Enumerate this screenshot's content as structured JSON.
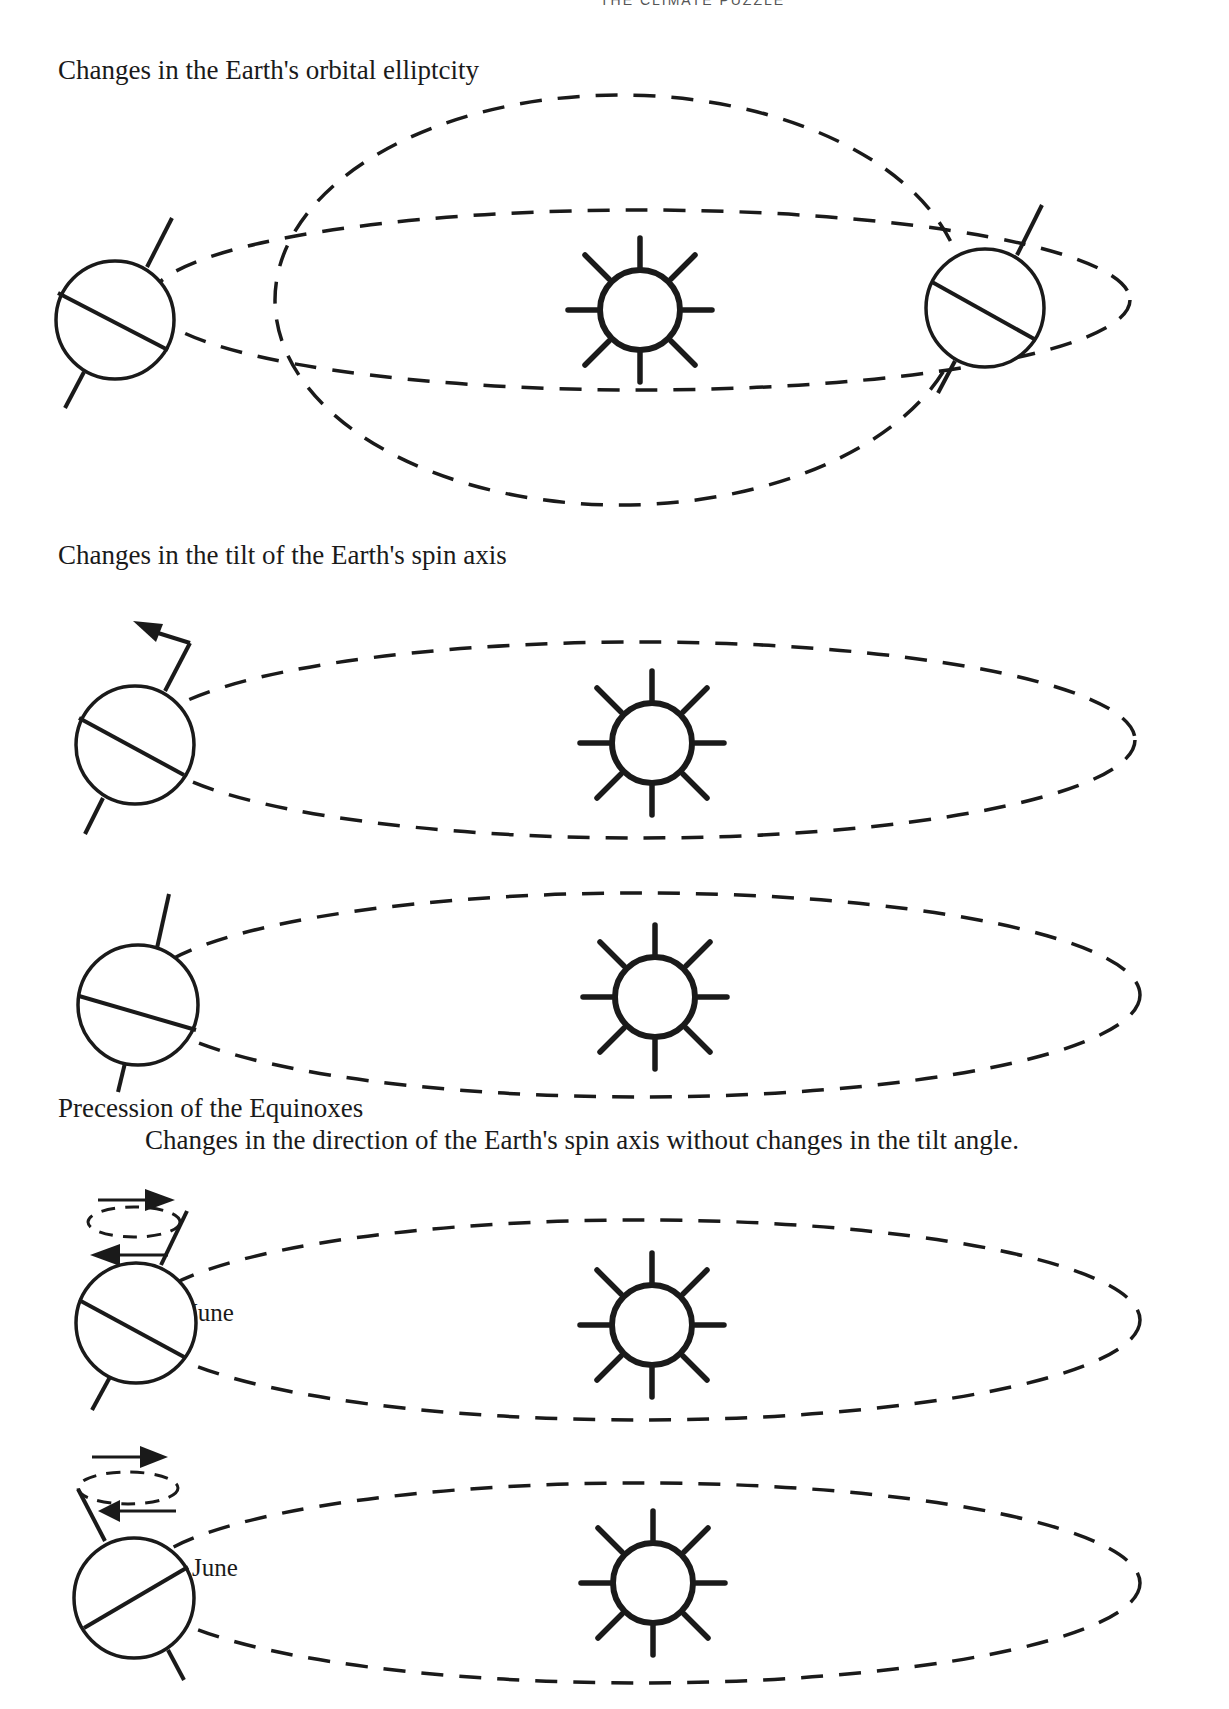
{
  "page": {
    "header_clipped": "THE CLIMATE PUZZLE"
  },
  "sections": [
    {
      "id": "eccentricity",
      "title": "Changes in the Earth's orbital elliptcity"
    },
    {
      "id": "obliquity",
      "title": "Changes in the tilt of the Earth's spin axis"
    },
    {
      "id": "precession",
      "title": "Precession of the Equinoxes",
      "subtitle": "Changes in the direction of the Earth's spin axis without changes in the tilt angle.",
      "labels": [
        "June",
        "June"
      ]
    }
  ],
  "icons": {
    "sun": "sun-icon",
    "earth": "earth-icon",
    "orbit": "dashed-ellipse",
    "arrow": "arrow-icon"
  },
  "colors": {
    "ink": "#1a1a1a",
    "paper": "#ffffff"
  }
}
